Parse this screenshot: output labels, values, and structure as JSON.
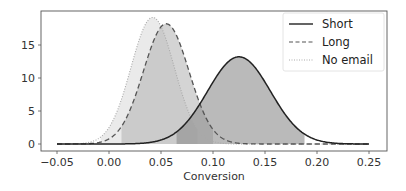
{
  "chart_data": {
    "type": "line",
    "title": "",
    "xlabel": "Conversion",
    "ylabel": "",
    "xlim": [
      -0.065,
      0.265
    ],
    "ylim": [
      -1,
      20.2
    ],
    "grid": false,
    "legend_position": "upper right",
    "x_ticks": [
      -0.05,
      0.0,
      0.05,
      0.1,
      0.15,
      0.2,
      0.25
    ],
    "x_tick_labels": [
      "−0.05",
      "0.00",
      "0.05",
      "0.10",
      "0.15",
      "0.20",
      "0.25"
    ],
    "y_ticks": [
      0,
      5,
      10,
      15
    ],
    "y_tick_labels": [
      "0",
      "5",
      "10",
      "15"
    ],
    "x_range": [
      -0.05,
      0.25
    ],
    "series": [
      {
        "name": "Short",
        "style": "solid",
        "distribution": "normal",
        "mean": 0.125,
        "sd": 0.0302,
        "peak": 13.2,
        "line_color": "#222222",
        "fill_color": "#8c8c8c",
        "fill_opacity": 0.6,
        "fill_range": [
          0.065,
          0.188
        ]
      },
      {
        "name": "Long",
        "style": "dashed",
        "distribution": "normal",
        "mean": 0.055,
        "sd": 0.0219,
        "peak": 18.2,
        "line_color": "#555555",
        "fill_color": "#b0b0b0",
        "fill_opacity": 0.55,
        "fill_range": [
          0.012,
          0.1
        ]
      },
      {
        "name": "No email",
        "style": "dotted",
        "distribution": "normal",
        "mean": 0.042,
        "sd": 0.0208,
        "peak": 19.2,
        "line_color": "#aaaaaa",
        "fill_color": "#d8d8d8",
        "fill_opacity": 0.55,
        "fill_range": [
          -0.008,
          0.085
        ]
      }
    ]
  },
  "legend": {
    "items": [
      {
        "label": "Short",
        "style": "solid"
      },
      {
        "label": "Long",
        "style": "dashed"
      },
      {
        "label": "No email",
        "style": "dotted"
      }
    ]
  }
}
